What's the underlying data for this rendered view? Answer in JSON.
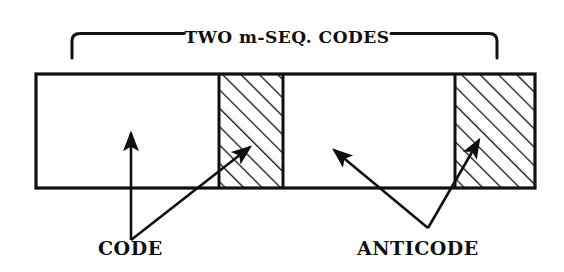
{
  "figure": {
    "kind": "technical-line-diagram",
    "background_color": "#ffffff",
    "ink_color": "#101010",
    "title": {
      "text": "TWO m-SEQ. CODES",
      "brace": {
        "shape": "horizontal-top-brace-with-downturned-ends",
        "left_x": 72,
        "right_x": 497,
        "baseline_y": 33,
        "end_drop_y": 58
      }
    },
    "bar": {
      "left": 36,
      "top": 74,
      "right": 535,
      "bottom": 188,
      "border_width": 3,
      "segments": [
        {
          "name": "code-segment-1",
          "fill": "white",
          "x0": 36,
          "x1": 219
        },
        {
          "name": "anticode-segment-1",
          "fill": "hatched",
          "x0": 219,
          "x1": 283
        },
        {
          "name": "code-segment-2",
          "fill": "white",
          "x0": 283,
          "x1": 455
        },
        {
          "name": "anticode-segment-2",
          "fill": "hatched",
          "x0": 455,
          "x1": 535
        }
      ],
      "hatch": {
        "angle_deg": 45,
        "direction": "up-to-the-right",
        "spacing_px": 13,
        "stroke_width": 2.6
      }
    },
    "labels": [
      {
        "id": "code",
        "text": "CODE",
        "x": 98,
        "baseline_y": 255,
        "leaders": [
          {
            "type": "vertical-arrow",
            "from": [
              131,
              240
            ],
            "to": [
              131,
              131
            ],
            "arrowhead": "up"
          },
          {
            "type": "diagonal-arrow",
            "from": [
              131,
              240
            ],
            "to": [
              252,
              145
            ],
            "arrowhead": "up-left-into-first-hatched-block"
          }
        ]
      },
      {
        "id": "anticode",
        "text": "ANTICODE",
        "x": 357,
        "baseline_y": 255,
        "leaders": [
          {
            "type": "diagonal-arrow",
            "from": [
              428,
              228
            ],
            "to": [
              332,
              148
            ],
            "arrowhead": "up-left-into-middle-white-block"
          },
          {
            "type": "diagonal-arrow",
            "from": [
              428,
              228
            ],
            "to": [
              481,
              138
            ],
            "arrowhead": "up-right-into-second-hatched-block"
          }
        ]
      }
    ]
  }
}
